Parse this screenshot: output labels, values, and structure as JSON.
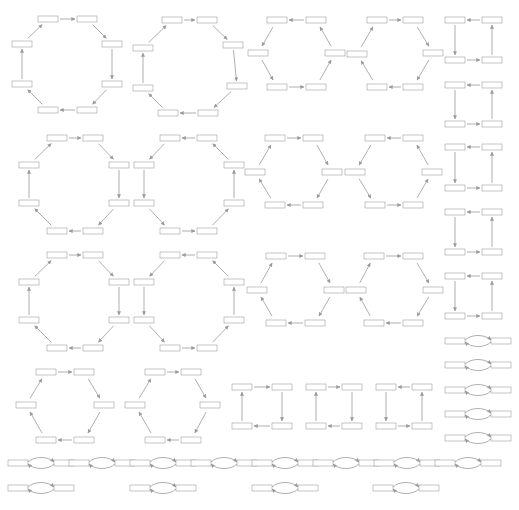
{
  "diagram": {
    "title": "",
    "background": "#ffffff",
    "colors": {
      "edge": "#9a9a9a",
      "white": "#ffffff",
      "light": "#cfcfcf",
      "mid": "#8c8c8c",
      "dark": "#3a3a3a",
      "black": "#111111"
    },
    "node_size": {
      "w": 20,
      "h": 6
    },
    "node_patterns": [
      [
        "white",
        "light",
        "dark",
        "light"
      ],
      [
        "white",
        "black",
        "dark",
        "dark"
      ],
      [
        "dark",
        "light",
        "black",
        "white"
      ],
      [
        "mid",
        "white",
        "dark",
        "light"
      ],
      [
        "light",
        "white",
        "black",
        "light"
      ],
      [
        "dark",
        "dark",
        "light",
        "dark"
      ],
      [
        "white",
        "mid",
        "black",
        "white"
      ],
      [
        "dark",
        "black",
        "white",
        "mid"
      ]
    ],
    "cycles": [
      {
        "type": "octagon",
        "direction": "cw",
        "nodes": [
          [
            48,
            19
          ],
          [
            87,
            19
          ],
          [
            112,
            44
          ],
          [
            112,
            84
          ],
          [
            87,
            110
          ],
          [
            48,
            110
          ],
          [
            22,
            84
          ],
          [
            22,
            44
          ]
        ]
      },
      {
        "type": "octagon",
        "direction": "cw",
        "nodes": [
          [
            172,
            20
          ],
          [
            207,
            20
          ],
          [
            233,
            45
          ],
          [
            237,
            86
          ],
          [
            208,
            113
          ],
          [
            168,
            113
          ],
          [
            143,
            88
          ],
          [
            143,
            48
          ]
        ]
      },
      {
        "type": "hexagon",
        "direction": "ccw",
        "nodes": [
          [
            277,
            20
          ],
          [
            316,
            20
          ],
          [
            335,
            53
          ],
          [
            316,
            87
          ],
          [
            277,
            87
          ],
          [
            258,
            53
          ]
        ]
      },
      {
        "type": "hexagon",
        "direction": "cw",
        "nodes": [
          [
            377,
            20
          ],
          [
            413,
            20
          ],
          [
            433,
            53
          ],
          [
            413,
            87
          ],
          [
            377,
            87
          ],
          [
            357,
            54
          ]
        ]
      },
      {
        "type": "square",
        "direction": "ccw",
        "nodes": [
          [
            455,
            20
          ],
          [
            492,
            20
          ],
          [
            492,
            60
          ],
          [
            455,
            60
          ]
        ]
      },
      {
        "type": "square",
        "direction": "ccw",
        "nodes": [
          [
            455,
            85
          ],
          [
            492,
            85
          ],
          [
            492,
            124
          ],
          [
            455,
            124
          ]
        ]
      },
      {
        "type": "octagon",
        "direction": "cw",
        "nodes": [
          [
            57,
            138
          ],
          [
            93,
            138
          ],
          [
            119,
            165
          ],
          [
            119,
            203
          ],
          [
            93,
            231
          ],
          [
            57,
            231
          ],
          [
            29,
            203
          ],
          [
            29,
            165
          ]
        ]
      },
      {
        "type": "octagon",
        "direction": "ccw",
        "nodes": [
          [
            170,
            138
          ],
          [
            207,
            138
          ],
          [
            234,
            165
          ],
          [
            234,
            203
          ],
          [
            207,
            231
          ],
          [
            170,
            231
          ],
          [
            144,
            203
          ],
          [
            144,
            165
          ]
        ]
      },
      {
        "type": "hexagon",
        "direction": "cw",
        "nodes": [
          [
            275,
            138
          ],
          [
            313,
            138
          ],
          [
            332,
            172
          ],
          [
            313,
            205
          ],
          [
            275,
            205
          ],
          [
            255,
            172
          ]
        ]
      },
      {
        "type": "hexagon",
        "direction": "ccw",
        "nodes": [
          [
            375,
            138
          ],
          [
            413,
            138
          ],
          [
            432,
            172
          ],
          [
            413,
            205
          ],
          [
            375,
            205
          ],
          [
            355,
            172
          ]
        ]
      },
      {
        "type": "square",
        "direction": "ccw",
        "nodes": [
          [
            455,
            147
          ],
          [
            492,
            147
          ],
          [
            492,
            188
          ],
          [
            455,
            188
          ]
        ]
      },
      {
        "type": "square",
        "direction": "ccw",
        "nodes": [
          [
            455,
            212
          ],
          [
            492,
            212
          ],
          [
            492,
            252
          ],
          [
            455,
            252
          ]
        ]
      },
      {
        "type": "octagon",
        "direction": "cw",
        "nodes": [
          [
            57,
            255
          ],
          [
            93,
            255
          ],
          [
            119,
            282
          ],
          [
            119,
            320
          ],
          [
            93,
            348
          ],
          [
            57,
            348
          ],
          [
            29,
            320
          ],
          [
            29,
            282
          ]
        ]
      },
      {
        "type": "octagon",
        "direction": "ccw",
        "nodes": [
          [
            170,
            255
          ],
          [
            207,
            255
          ],
          [
            234,
            282
          ],
          [
            234,
            320
          ],
          [
            207,
            348
          ],
          [
            170,
            348
          ],
          [
            144,
            320
          ],
          [
            144,
            282
          ]
        ]
      },
      {
        "type": "hexagon",
        "direction": "cw",
        "nodes": [
          [
            276,
            256
          ],
          [
            315,
            256
          ],
          [
            334,
            290
          ],
          [
            315,
            323
          ],
          [
            276,
            323
          ],
          [
            257,
            290
          ]
        ]
      },
      {
        "type": "hexagon",
        "direction": "cw",
        "nodes": [
          [
            374,
            256
          ],
          [
            413,
            256
          ],
          [
            433,
            290
          ],
          [
            413,
            323
          ],
          [
            374,
            323
          ],
          [
            356,
            290
          ]
        ]
      },
      {
        "type": "square",
        "direction": "ccw",
        "nodes": [
          [
            455,
            276
          ],
          [
            492,
            276
          ],
          [
            492,
            316
          ],
          [
            455,
            316
          ]
        ]
      },
      {
        "type": "hexagon",
        "direction": "cw",
        "nodes": [
          [
            46,
            372
          ],
          [
            84,
            372
          ],
          [
            104,
            405
          ],
          [
            84,
            440
          ],
          [
            46,
            440
          ],
          [
            26,
            405
          ]
        ]
      },
      {
        "type": "hexagon",
        "direction": "cw",
        "nodes": [
          [
            155,
            372
          ],
          [
            191,
            372
          ],
          [
            210,
            405
          ],
          [
            191,
            440
          ],
          [
            155,
            440
          ],
          [
            135,
            405
          ]
        ]
      },
      {
        "type": "square",
        "direction": "cw",
        "nodes": [
          [
            242,
            387
          ],
          [
            282,
            387
          ],
          [
            282,
            426
          ],
          [
            242,
            426
          ]
        ]
      },
      {
        "type": "square",
        "direction": "cw",
        "nodes": [
          [
            316,
            387
          ],
          [
            352,
            387
          ],
          [
            352,
            426
          ],
          [
            316,
            426
          ]
        ]
      },
      {
        "type": "square",
        "direction": "ccw",
        "nodes": [
          [
            386,
            387
          ],
          [
            422,
            387
          ],
          [
            422,
            426
          ],
          [
            386,
            426
          ]
        ]
      }
    ],
    "bigons": [
      [
        455,
        341
      ],
      [
        455,
        365
      ],
      [
        455,
        390
      ],
      [
        455,
        414
      ],
      [
        455,
        438
      ],
      [
        18,
        463
      ],
      [
        79,
        463
      ],
      [
        140,
        463
      ],
      [
        201,
        463
      ],
      [
        262,
        463
      ],
      [
        323,
        463
      ],
      [
        384,
        463
      ],
      [
        445,
        463
      ],
      [
        18,
        488
      ],
      [
        140,
        488
      ],
      [
        262,
        488
      ],
      [
        383,
        488
      ]
    ]
  }
}
